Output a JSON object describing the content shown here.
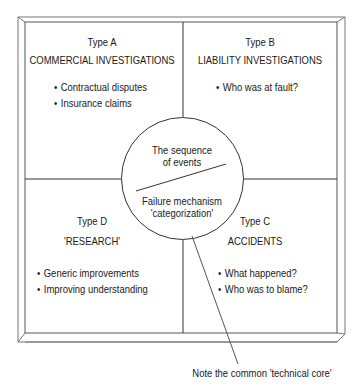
{
  "diagram": {
    "quadrants": [
      {
        "id": "A",
        "type_label": "Type A",
        "title": "COMMERCIAL INVESTIGATIONS",
        "bullets": [
          "Contractual disputes",
          "Insurance claims"
        ]
      },
      {
        "id": "B",
        "type_label": "Type B",
        "title": "LIABILITY INVESTIGATIONS",
        "bullets": [
          "Who was at fault?"
        ]
      },
      {
        "id": "C",
        "type_label": "Type C",
        "title": "ACCIDENTS",
        "bullets": [
          "What happened?",
          "Who was to blame?"
        ]
      },
      {
        "id": "D",
        "type_label": "Type D",
        "title": "'RESEARCH'",
        "bullets": [
          "Generic improvements",
          "Improving understanding"
        ]
      }
    ],
    "core": {
      "upper_line1": "The sequence",
      "upper_line2": "of events",
      "lower_line1": "Failure mechanism",
      "lower_line2": "'categorization'"
    },
    "annotation": "Note the common 'technical core'",
    "colors": {
      "line": "#333333",
      "bevel": "#777777",
      "text": "#1a1a1a",
      "background": "#ffffff"
    }
  }
}
